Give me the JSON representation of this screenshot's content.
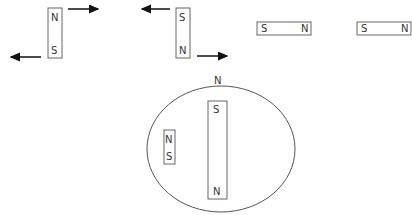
{
  "diagram": {
    "magnet1": {
      "top": "N",
      "bottom": "S"
    },
    "magnet2": {
      "top": "S",
      "bottom": "N"
    },
    "magnet3": {
      "left": "S",
      "right": "N"
    },
    "magnet4": {
      "left": "S",
      "right": "N"
    },
    "earth": {
      "pole_label": "N",
      "big_magnet": {
        "top": "S",
        "bottom": "N"
      },
      "small_magnet": {
        "top": "N",
        "bottom": "S"
      }
    }
  },
  "colors": {
    "stroke": "#555555",
    "arrow": "#111111",
    "text": "#333333"
  }
}
